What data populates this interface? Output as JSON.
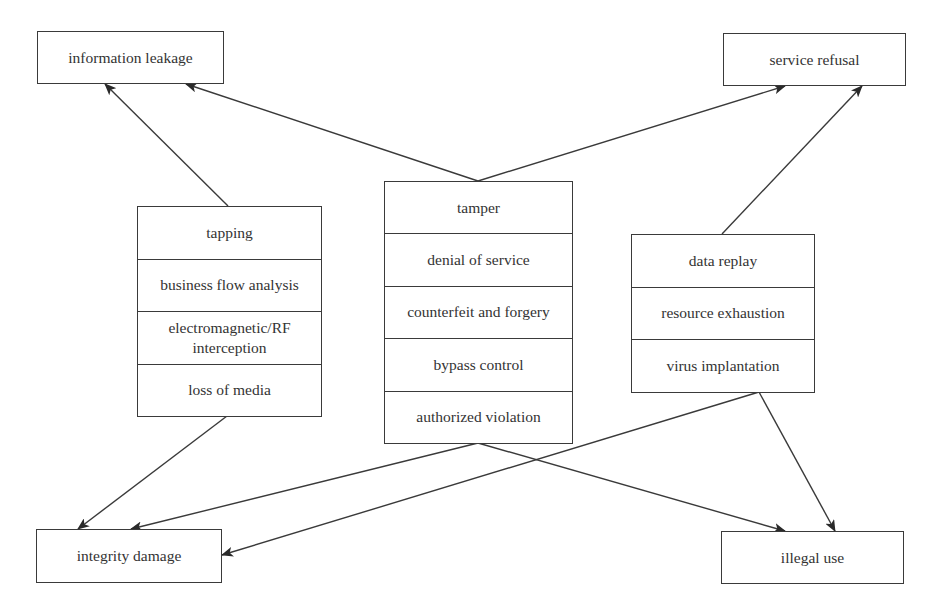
{
  "diagram": {
    "outcomes": {
      "information_leakage": "information leakage",
      "service_refusal": "service refusal",
      "integrity_damage": "integrity damage",
      "illegal_use": "illegal use"
    },
    "left_group": [
      "tapping",
      "business flow analysis",
      "electromagnetic/RF interception",
      "loss of media"
    ],
    "center_group": [
      "tamper",
      "denial of service",
      "counterfeit and forgery",
      "bypass control",
      "authorized violation"
    ],
    "right_group": [
      "data replay",
      "resource exhaustion",
      "virus implantation"
    ],
    "edges": [
      {
        "from": "left_group",
        "to": "information leakage"
      },
      {
        "from": "center_group",
        "to": "information leakage"
      },
      {
        "from": "center_group",
        "to": "service refusal"
      },
      {
        "from": "right_group",
        "to": "service refusal"
      },
      {
        "from": "left_group",
        "to": "integrity damage"
      },
      {
        "from": "center_group",
        "to": "integrity damage"
      },
      {
        "from": "center_group",
        "to": "illegal use"
      },
      {
        "from": "right_group",
        "to": "integrity damage"
      },
      {
        "from": "right_group",
        "to": "illegal use"
      }
    ],
    "colors": {
      "line": "#3a3a3a",
      "text": "#333333",
      "background": "#ffffff"
    }
  }
}
